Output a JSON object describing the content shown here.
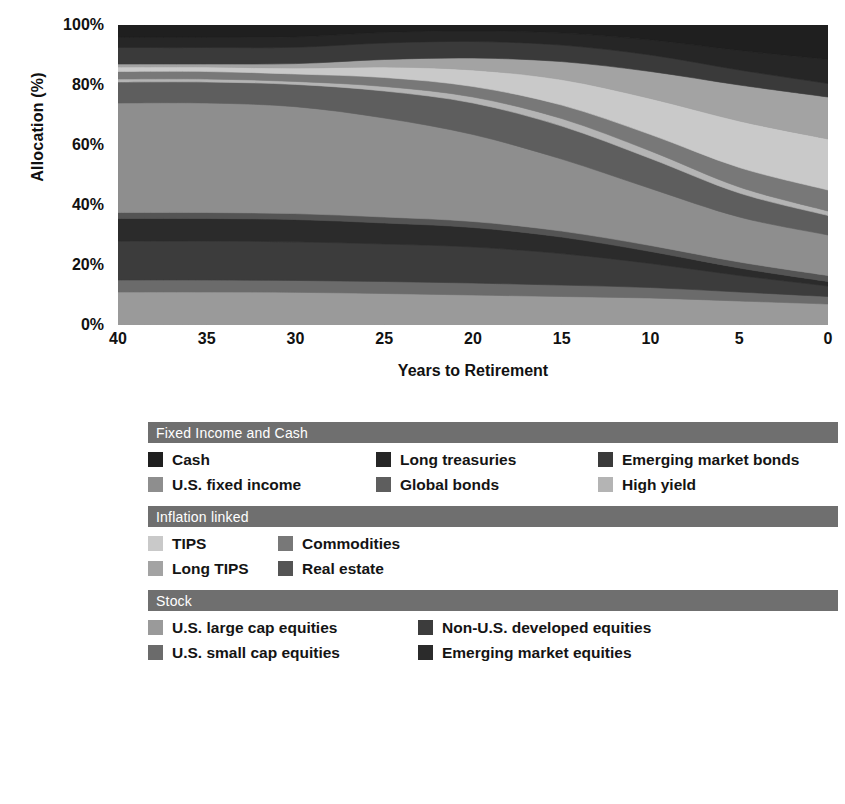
{
  "chart_data": {
    "type": "area",
    "stacked": true,
    "title": "",
    "xlabel": "Years to Retirement",
    "ylabel": "Allocation (%)",
    "x": [
      40,
      35,
      30,
      25,
      20,
      15,
      10,
      5,
      0
    ],
    "xticks": [
      "40",
      "35",
      "30",
      "25",
      "20",
      "15",
      "10",
      "5",
      "0"
    ],
    "xlim": [
      40,
      0
    ],
    "x_reversed": true,
    "yticks": [
      "0%",
      "20%",
      "40%",
      "60%",
      "80%",
      "100%"
    ],
    "ytick_values": [
      0,
      20,
      40,
      60,
      80,
      100
    ],
    "ylim": [
      0,
      100
    ],
    "grid": false,
    "legend_position": "below",
    "series": [
      {
        "name": "U.S. large cap equities",
        "color": "#9a9a9a",
        "values": [
          11.0,
          11.0,
          11.0,
          10.5,
          10.0,
          9.5,
          9.0,
          8.0,
          7.0
        ]
      },
      {
        "name": "U.S. small cap equities",
        "color": "#6b6b6b",
        "values": [
          4.0,
          4.0,
          4.0,
          4.0,
          4.0,
          3.8,
          3.5,
          3.0,
          2.5
        ]
      },
      {
        "name": "Non-U.S. developed equities",
        "color": "#3c3c3c",
        "values": [
          13.0,
          13.0,
          13.0,
          12.5,
          12.0,
          10.5,
          8.0,
          5.5,
          3.5
        ]
      },
      {
        "name": "Emerging market equities",
        "color": "#2b2b2b",
        "values": [
          7.5,
          7.5,
          7.5,
          7.0,
          6.5,
          5.5,
          4.0,
          2.5,
          1.5
        ]
      },
      {
        "name": "Real estate",
        "color": "#545454",
        "values": [
          2.0,
          2.0,
          2.0,
          2.0,
          2.0,
          2.0,
          2.0,
          2.0,
          2.0
        ]
      },
      {
        "name": "U.S. fixed income",
        "color": "#8e8e8e",
        "values": [
          36.5,
          36.5,
          36.0,
          33.0,
          29.0,
          24.0,
          19.0,
          15.0,
          13.5
        ]
      },
      {
        "name": "Global bonds",
        "color": "#5e5e5e",
        "values": [
          7.0,
          7.0,
          7.5,
          9.0,
          10.5,
          11.0,
          10.0,
          8.0,
          6.5
        ]
      },
      {
        "name": "High yield",
        "color": "#b4b4b4",
        "values": [
          1.0,
          1.0,
          1.0,
          1.5,
          2.0,
          2.5,
          2.5,
          2.0,
          1.5
        ]
      },
      {
        "name": "Commodities",
        "color": "#787878",
        "values": [
          2.5,
          2.5,
          2.5,
          3.0,
          3.5,
          4.5,
          5.5,
          6.5,
          7.0
        ]
      },
      {
        "name": "TIPS",
        "color": "#c9c9c9",
        "values": [
          1.5,
          1.5,
          2.0,
          3.5,
          5.5,
          8.5,
          12.0,
          15.5,
          17.0
        ]
      },
      {
        "name": "Long TIPS",
        "color": "#a3a3a3",
        "values": [
          1.0,
          1.0,
          1.5,
          2.5,
          4.0,
          6.0,
          9.0,
          12.0,
          14.0
        ]
      },
      {
        "name": "Emerging market bonds",
        "color": "#3a3a3a",
        "values": [
          5.5,
          5.5,
          5.5,
          5.5,
          5.5,
          5.5,
          5.5,
          5.0,
          4.5
        ]
      },
      {
        "name": "Long treasuries",
        "color": "#262626",
        "values": [
          3.5,
          3.5,
          3.5,
          3.5,
          3.5,
          4.0,
          5.0,
          6.5,
          8.0
        ]
      },
      {
        "name": "Cash",
        "color": "#1f1f1f",
        "values": [
          4.0,
          4.0,
          4.0,
          2.5,
          2.0,
          2.7,
          5.0,
          8.5,
          11.5
        ]
      }
    ]
  },
  "axes": {
    "ylabel": "Allocation (%)",
    "xlabel": "Years to Retirement",
    "yticks": [
      "100%",
      "80%",
      "60%",
      "40%",
      "20%",
      "0%"
    ],
    "xticks": [
      "40",
      "35",
      "30",
      "25",
      "20",
      "15",
      "10",
      "5",
      "0"
    ]
  },
  "legend": {
    "groups": [
      {
        "title": "Fixed Income and Cash",
        "rows": [
          [
            {
              "label": "Cash",
              "color": "#1f1f1f"
            },
            {
              "label": "Long treasuries",
              "color": "#262626"
            },
            {
              "label": "Emerging market bonds",
              "color": "#3a3a3a"
            }
          ],
          [
            {
              "label": "U.S. fixed income",
              "color": "#8e8e8e"
            },
            {
              "label": "Global bonds",
              "color": "#5e5e5e"
            },
            {
              "label": "High yield",
              "color": "#b4b4b4"
            }
          ]
        ]
      },
      {
        "title": "Inflation linked",
        "rows": [
          [
            {
              "label": "TIPS",
              "color": "#c9c9c9"
            },
            {
              "label": "Commodities",
              "color": "#787878"
            }
          ],
          [
            {
              "label": "Long TIPS",
              "color": "#a3a3a3"
            },
            {
              "label": "Real estate",
              "color": "#545454"
            }
          ]
        ]
      },
      {
        "title": "Stock",
        "rows": [
          [
            {
              "label": "U.S. large cap equities",
              "color": "#9a9a9a"
            },
            {
              "label": "Non-U.S. developed equities",
              "color": "#3c3c3c"
            }
          ],
          [
            {
              "label": "U.S. small cap equities",
              "color": "#6b6b6b"
            },
            {
              "label": "Emerging market equities",
              "color": "#2b2b2b"
            }
          ]
        ]
      }
    ]
  },
  "colors": {
    "group_bar": "#6f6f6f",
    "group_bar_text": "#ffffff",
    "background": "#ffffff",
    "text": "#141414"
  }
}
